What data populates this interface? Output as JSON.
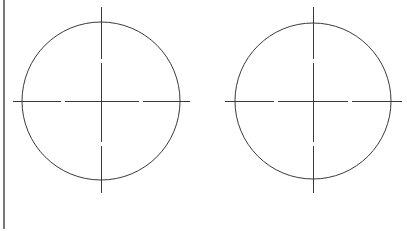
{
  "diagram": {
    "title": "",
    "stroke_color": "#3a3a3a",
    "border_color": "#555555",
    "left_border": {
      "x": 4,
      "y1": 0,
      "y2": 229
    },
    "circles": [
      {
        "name": "left-circle",
        "cx": 101,
        "cy": 101,
        "r": 79,
        "h_axis": {
          "x1": 13,
          "x2": 190,
          "gaps": [
            63,
            141
          ]
        },
        "v_axis": {
          "y1": 7,
          "y2": 193,
          "gaps": [
            61,
            144
          ]
        }
      },
      {
        "name": "right-circle",
        "cx": 313,
        "cy": 101,
        "r": 78,
        "h_axis": {
          "x1": 225,
          "x2": 402,
          "gaps": [
            276,
            350
          ]
        },
        "v_axis": {
          "y1": 7,
          "y2": 193,
          "gaps": [
            61,
            144
          ]
        }
      }
    ]
  }
}
